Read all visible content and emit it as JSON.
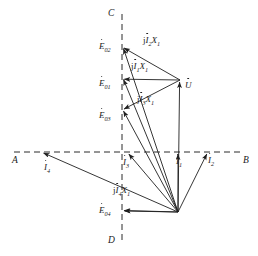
{
  "figure": {
    "type": "phasor-diagram",
    "background": "#ffffff",
    "stroke_color": "#1f1f1f",
    "text_color": "#1a1a1a",
    "width": 258,
    "height": 256
  },
  "axes": {
    "horizontal": {
      "name": "AB",
      "style": "dashed",
      "left_label": "A",
      "right_label": "B",
      "y": 152,
      "x_start": 14,
      "x_end": 244
    },
    "vertical": {
      "name": "CD",
      "style": "dashed",
      "top_label": "C",
      "bottom_label": "D",
      "x": 122,
      "y_start": 14,
      "y_end": 244
    }
  },
  "origin": {
    "x": 178,
    "y": 212
  },
  "points": {
    "E02": {
      "x": 122,
      "y": 47
    },
    "E01": {
      "x": 122,
      "y": 78
    },
    "E03": {
      "x": 122,
      "y": 110
    },
    "E04": {
      "x": 122,
      "y": 210
    },
    "U": {
      "x": 180,
      "y": 80
    },
    "I1": {
      "x": 178,
      "y": 152
    },
    "I2": {
      "x": 208,
      "y": 152
    },
    "I3": {
      "x": 127,
      "y": 152
    },
    "I4": {
      "x": 42,
      "y": 152
    }
  },
  "labels": {
    "axis_A": "A",
    "axis_B": "B",
    "axis_C": "C",
    "axis_D": "D",
    "E02": {
      "base": "E",
      "sub": "02"
    },
    "E01": {
      "base": "E",
      "sub": "01"
    },
    "E03": {
      "base": "E",
      "sub": "03"
    },
    "E04": {
      "base": "E",
      "sub": "04"
    },
    "U": {
      "base": "U"
    },
    "I1": {
      "base": "I",
      "sub": "1"
    },
    "I2": {
      "base": "I",
      "sub": "2"
    },
    "I3": {
      "base": "I",
      "sub": "3"
    },
    "I4": {
      "base": "I",
      "sub": "4"
    },
    "jI1X1": {
      "prefix": "j",
      "base": "I",
      "sub": "1",
      "tail": "X",
      "tailsub": "1"
    },
    "jI2X1": {
      "prefix": "j",
      "base": "I",
      "sub": "2",
      "tail": "X",
      "tailsub": "1"
    },
    "jI3X1": {
      "prefix": "j",
      "base": "I",
      "sub": "3",
      "tail": "X",
      "tailsub": "1"
    },
    "jI4X1": {
      "prefix": "j",
      "base": "I",
      "sub": "4",
      "tail": "X",
      "tailsub": "1"
    }
  },
  "vectors": [
    {
      "name": "E02-phasor",
      "from": "origin",
      "to": "E02",
      "arrow_at": "to"
    },
    {
      "name": "E01-phasor",
      "from": "origin",
      "to": "E01",
      "arrow_at": "to"
    },
    {
      "name": "E03-phasor",
      "from": "origin",
      "to": "E03",
      "arrow_at": "to"
    },
    {
      "name": "E04-phasor",
      "from": "origin",
      "to": "E04",
      "arrow_at": "to"
    },
    {
      "name": "U-phasor",
      "from": "origin",
      "to": "U",
      "arrow_at": "to"
    },
    {
      "name": "I1-phasor",
      "from": "origin",
      "to": "I1",
      "arrow_at": "to"
    },
    {
      "name": "I2-phasor",
      "from": "origin",
      "to": "I2",
      "arrow_at": "to"
    },
    {
      "name": "I3-phasor",
      "from": "origin",
      "to": "I3",
      "arrow_at": "to"
    },
    {
      "name": "I4-phasor",
      "from": "origin",
      "to": "I4",
      "arrow_at": "to"
    },
    {
      "name": "jI2X1-drop",
      "from": "U",
      "to": "E02",
      "arrow_at": "to"
    },
    {
      "name": "jI1X1-drop",
      "from": "U",
      "to": "E01",
      "arrow_at": "to"
    },
    {
      "name": "jI3X1-drop",
      "from": "U",
      "to": "E03",
      "arrow_at": "to"
    },
    {
      "name": "jI4X1-drop",
      "from": "origin",
      "to": "E04",
      "arrow_at": "to"
    }
  ]
}
